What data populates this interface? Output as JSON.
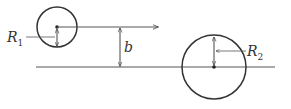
{
  "diagram": {
    "labels": {
      "r1": "R",
      "r1_sub": "1",
      "r2": "R",
      "r2_sub": "2",
      "b": "b"
    },
    "stroke_color": "#333333",
    "circle1": {
      "cx": 57,
      "cy": 27,
      "r": 20
    },
    "circle2": {
      "cx": 214,
      "cy": 67,
      "r": 32
    },
    "baseline": {
      "x1": 36,
      "x2": 275,
      "y": 67
    },
    "velocity_arrow": {
      "x1": 57,
      "x2": 158,
      "y": 27
    },
    "impact_parameter_arrow": {
      "x": 120,
      "y1": 27,
      "y2": 67
    }
  }
}
